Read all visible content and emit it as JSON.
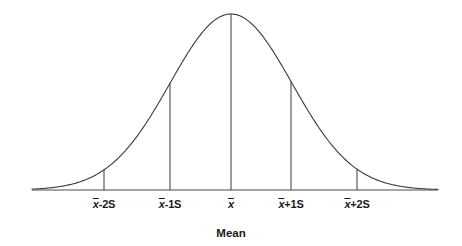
{
  "figure": {
    "background_color": "#ffffff",
    "curve_color": "#3a3a3a",
    "axis_color": "#4a4a4a",
    "text_color": "#1a1a1a",
    "width": 462,
    "height": 246
  },
  "axis": {
    "caption": "Mean",
    "caption_x": 231,
    "caption_y": 228,
    "baseline_y": 190,
    "x_start": 32,
    "x_end": 438
  },
  "tick_labels": [
    {
      "id": "minus-2s",
      "prefix": "x",
      "suffix": "-2S",
      "x": 104,
      "y": 198
    },
    {
      "id": "minus-1s",
      "prefix": "x",
      "suffix": "-1S",
      "x": 170,
      "y": 198
    },
    {
      "id": "mean",
      "prefix": "x",
      "suffix": "",
      "x": 231,
      "y": 198
    },
    {
      "id": "plus-1s",
      "prefix": "x",
      "suffix": "+1S",
      "x": 291,
      "y": 198
    },
    {
      "id": "plus-2s",
      "prefix": "x",
      "suffix": "+2S",
      "x": 357,
      "y": 198
    }
  ],
  "chart_data": {
    "type": "line",
    "title": "",
    "subtitle": "",
    "xlabel": "Mean",
    "ylabel": "",
    "grid": false,
    "legend": null,
    "distribution": "normal",
    "mean_px": 231,
    "sigma_px": 61,
    "peak_y_px": 14,
    "baseline_y_px": 190,
    "xlim": [
      32,
      438
    ],
    "ylim": [
      0,
      1
    ],
    "tick_positions_sigma": [
      -2,
      -1,
      0,
      1,
      2
    ],
    "tick_text": [
      "x̄-2S",
      "x̄-1S",
      "x̄",
      "x̄+1S",
      "x̄+2S"
    ],
    "x": [
      32,
      47,
      62,
      77,
      92,
      104,
      119,
      134,
      149,
      170,
      185,
      200,
      215,
      231,
      246,
      261,
      276,
      291,
      306,
      321,
      336,
      357,
      372,
      387,
      402,
      417,
      438
    ],
    "values": [
      0.002,
      0.005,
      0.012,
      0.027,
      0.055,
      0.089,
      0.162,
      0.264,
      0.393,
      0.607,
      0.744,
      0.865,
      0.953,
      1.0,
      0.953,
      0.865,
      0.744,
      0.607,
      0.456,
      0.32,
      0.21,
      0.089,
      0.049,
      0.025,
      0.012,
      0.005,
      0.002
    ],
    "drop_lines": [
      {
        "label": "x̄-2S",
        "x_px": 104,
        "sigma": -2,
        "top_y_px": 168,
        "height_norm": 0.135
      },
      {
        "label": "x̄-1S",
        "x_px": 170,
        "sigma": -1,
        "top_y_px": 83,
        "height_norm": 0.607
      },
      {
        "label": "x̄",
        "x_px": 231,
        "sigma": 0,
        "top_y_px": 14,
        "height_norm": 1.0
      },
      {
        "label": "x̄+1S",
        "x_px": 291,
        "sigma": 1,
        "top_y_px": 83,
        "height_norm": 0.607
      },
      {
        "label": "x̄+2S",
        "x_px": 357,
        "sigma": 2,
        "top_y_px": 168,
        "height_norm": 0.135
      }
    ]
  }
}
